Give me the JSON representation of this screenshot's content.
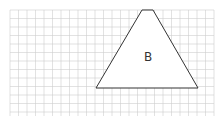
{
  "diagram": {
    "type": "grid-shape",
    "grid": {
      "x0": 10,
      "y0": 10,
      "x1": 214,
      "y1": 116,
      "cell": 8.5,
      "line_color": "#cfcfcf"
    },
    "shape": {
      "kind": "trapezoid",
      "label": "B",
      "stroke": "#333333",
      "fill": "#ffffff",
      "points": [
        [
          142,
          10
        ],
        [
          153,
          10
        ],
        [
          198,
          88
        ],
        [
          96,
          88
        ]
      ]
    }
  }
}
